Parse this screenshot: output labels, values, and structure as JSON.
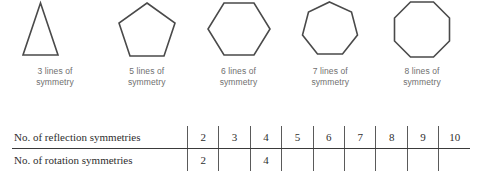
{
  "figure": {
    "shapes": [
      {
        "name": "triangle",
        "sides": 3,
        "caption": "3 lines of\nsymmetry",
        "points": "35,55 0,55 17.5,3"
      },
      {
        "name": "pentagon",
        "sides": 5,
        "caption": "5 lines of\nsymmetry",
        "points": "29,3 57,23 46,56 12,56 1,23"
      },
      {
        "name": "hexagon",
        "sides": 6,
        "caption": "6 lines of\nsymmetry",
        "points": "17,3 47,3 63,29 47,55 17,55 1,29"
      },
      {
        "name": "heptagon",
        "sides": 7,
        "caption": "7 lines of\nsymmetry",
        "points": "28,2 50,12 56,35 41,54 16,54 1,35 7,12"
      },
      {
        "name": "octagon",
        "sides": 8,
        "caption": "8 lines of\nsymmetry",
        "points": "19,2 42,2 58,18 58,41 42,57 19,57 3,41 3,18"
      }
    ]
  },
  "table": {
    "rows": [
      {
        "label": "No. of reflection symmetries",
        "values": [
          "2",
          "3",
          "4",
          "5",
          "6",
          "7",
          "8",
          "9",
          "10"
        ]
      },
      {
        "label": "No. of rotation symmetries",
        "values": [
          "2",
          "",
          "4",
          "",
          "",
          "",
          "",
          "",
          ""
        ]
      }
    ]
  },
  "colors": {
    "shape_stroke": "#4a4a4a",
    "caption_text": "#6f6f6f",
    "table_text": "#2e2e2e",
    "table_rule": "#3a3a3a",
    "background": "#ffffff"
  }
}
